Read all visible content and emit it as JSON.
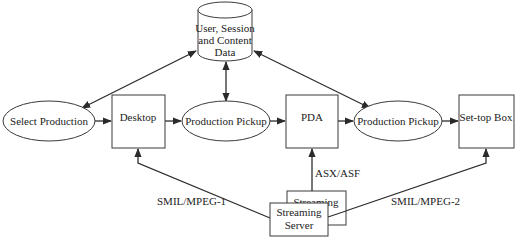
{
  "diagram": {
    "type": "flow",
    "database": {
      "label_lines": [
        "User, Session",
        "and Content",
        "Data"
      ]
    },
    "nodes": {
      "select_production": {
        "label": "Select Production",
        "shape": "ellipse"
      },
      "desktop": {
        "label": "Desktop",
        "shape": "box"
      },
      "production_pickup_1": {
        "label": "Production Pickup",
        "shape": "ellipse"
      },
      "pda": {
        "label": "PDA",
        "shape": "box"
      },
      "production_pickup_2": {
        "label": "Production Pickup",
        "shape": "ellipse"
      },
      "settop_box": {
        "label": "Set-top Box",
        "shape": "box"
      },
      "streaming_server_back": {
        "label": "Streaming",
        "shape": "box"
      },
      "streaming_server_front": {
        "label_lines": [
          "Streaming",
          "Server"
        ],
        "shape": "box"
      }
    },
    "edge_labels": {
      "desktop_stream": "SMIL/MPEG-1",
      "pda_stream": "ASX/ASF",
      "settop_stream": "SMIL/MPEG-2"
    },
    "edges": [
      {
        "from": "database",
        "to": "select_production",
        "direction": "both"
      },
      {
        "from": "database",
        "to": "production_pickup_1",
        "direction": "both"
      },
      {
        "from": "database",
        "to": "production_pickup_2",
        "direction": "both"
      },
      {
        "from": "select_production",
        "to": "desktop",
        "direction": "forward"
      },
      {
        "from": "desktop",
        "to": "production_pickup_1",
        "direction": "forward"
      },
      {
        "from": "production_pickup_1",
        "to": "pda",
        "direction": "forward"
      },
      {
        "from": "pda",
        "to": "production_pickup_2",
        "direction": "forward"
      },
      {
        "from": "production_pickup_2",
        "to": "settop_box",
        "direction": "forward"
      },
      {
        "from": "streaming_server",
        "to": "desktop",
        "label": "SMIL/MPEG-1",
        "direction": "forward"
      },
      {
        "from": "streaming_server",
        "to": "pda",
        "label": "ASX/ASF",
        "direction": "forward"
      },
      {
        "from": "streaming_server",
        "to": "settop_box",
        "label": "SMIL/MPEG-2",
        "direction": "forward"
      }
    ]
  }
}
